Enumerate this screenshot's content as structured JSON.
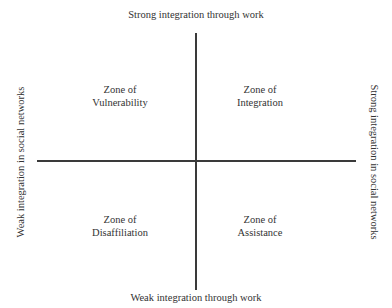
{
  "diagram": {
    "type": "quadrant",
    "axes": {
      "vertical": {
        "top_label": "Strong integration through work",
        "bottom_label": "Weak integration through work"
      },
      "horizontal": {
        "left_label": "Weak integration in social networks",
        "right_label": "Strong integration in social networks"
      }
    },
    "quadrants": {
      "top_left": {
        "line1": "Zone of",
        "line2": "Vulnerability"
      },
      "top_right": {
        "line1": "Zone of",
        "line2": "Integration"
      },
      "bottom_left": {
        "line1": "Zone of",
        "line2": "Disaffiliation"
      },
      "bottom_right": {
        "line1": "Zone of",
        "line2": "Assistance"
      }
    },
    "colors": {
      "line": "#3a3a3a",
      "text": "#333333",
      "background": "#ffffff"
    }
  }
}
